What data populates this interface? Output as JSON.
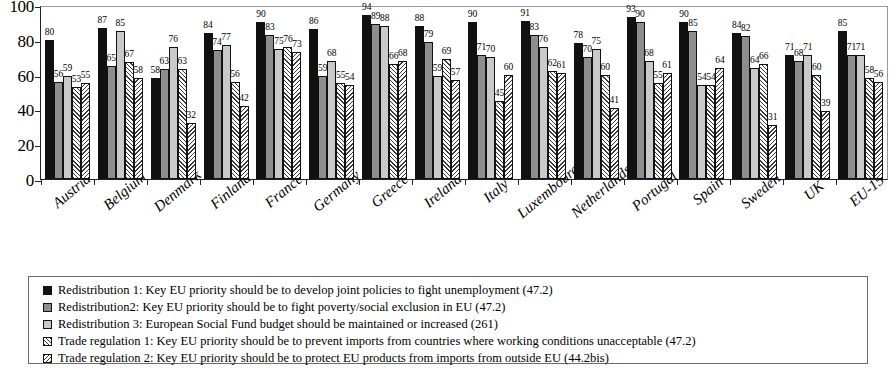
{
  "chart_data": {
    "type": "bar",
    "title": "",
    "xlabel": "",
    "ylabel": "",
    "ylim": [
      0,
      100
    ],
    "yticks": [
      0,
      20,
      40,
      60,
      80,
      100
    ],
    "grid": false,
    "legend_position": "bottom",
    "categories": [
      "Austria",
      "Belgium",
      "Denmark",
      "Finland",
      "France",
      "Germany",
      "Greece",
      "Ireland",
      "Italy",
      "Luxembourg",
      "Netherlands",
      "Portugal",
      "Spain",
      "Sweden",
      "UK",
      "EU-15"
    ],
    "series": [
      {
        "name": "Redistribution 1:  Key EU priority should be to develop joint policies to fight unemployment (47.2)",
        "swatch": "solid-black",
        "color": "#111111",
        "values": [
          80,
          87,
          58,
          84,
          90,
          86,
          94,
          88,
          90,
          91,
          78,
          93,
          90,
          84,
          71,
          85
        ]
      },
      {
        "name": "Redistribution2: Key EU priority should be to fight poverty/social exclusion in EU (47.2)",
        "swatch": "solid-darkgray",
        "color": "#8e8e8e",
        "values": [
          56,
          65,
          63,
          74,
          83,
          59,
          89,
          79,
          71,
          83,
          70,
          90,
          85,
          82,
          68,
          71
        ]
      },
      {
        "name": "Redistribution 3: European Social Fund budget should be maintained or increased (261)",
        "swatch": "solid-lightgray",
        "color": "#c9c9c9",
        "values": [
          59,
          85,
          76,
          77,
          75,
          68,
          88,
          59,
          70,
          76,
          75,
          68,
          54,
          64,
          71,
          71
        ]
      },
      {
        "name": "Trade regulation 1: Key EU priority should be to prevent imports from countries where working conditions unacceptable (47.2)",
        "swatch": "hatch-forward",
        "color": "#ffffff",
        "values": [
          53,
          67,
          63,
          56,
          76,
          55,
          66,
          69,
          45,
          62,
          60,
          55,
          54,
          66,
          60,
          58
        ]
      },
      {
        "name": "Trade regulation 2: Key EU priority should be to protect EU products from imports from outside EU (44.2bis)",
        "swatch": "hatch-back",
        "color": "#ffffff",
        "values": [
          55,
          58,
          32,
          42,
          73,
          54,
          68,
          57,
          60,
          61,
          41,
          61,
          64,
          31,
          39,
          56
        ]
      }
    ]
  }
}
